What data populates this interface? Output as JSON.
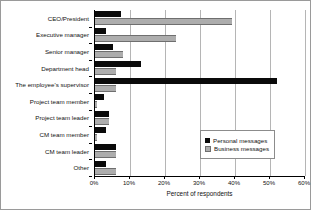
{
  "chart_data": {
    "type": "bar",
    "orientation": "horizontal",
    "title": "",
    "xlabel": "Percent of respondents",
    "ylabel": "",
    "xlim": [
      0,
      60
    ],
    "xticks": [
      "0%",
      "10%",
      "20%",
      "30%",
      "40%",
      "50%",
      "60%"
    ],
    "xtick_values": [
      0,
      10,
      20,
      30,
      40,
      50,
      60
    ],
    "grid": "vertical",
    "legend_position": "lower-right-inside",
    "categories": [
      "CEO/President",
      "Executive manager",
      "Senior manager",
      "Department head",
      "The employee's supervisor",
      "Project team member",
      "Project team leader",
      "CM team member",
      "CM team leader",
      "Other"
    ],
    "series": [
      {
        "name": "Personal messages",
        "color": "#0a0a0a",
        "values": [
          7.5,
          3,
          5,
          13,
          52,
          2.5,
          4,
          3,
          6,
          3
        ]
      },
      {
        "name": "Business messages",
        "color": "#adadad",
        "values": [
          39,
          23,
          8,
          6,
          6,
          0.5,
          4,
          0.5,
          6,
          6
        ]
      }
    ]
  },
  "legend": {
    "items": [
      {
        "label": "Personal messages",
        "swatch": "personal"
      },
      {
        "label": "Business messages",
        "swatch": "business"
      }
    ]
  }
}
